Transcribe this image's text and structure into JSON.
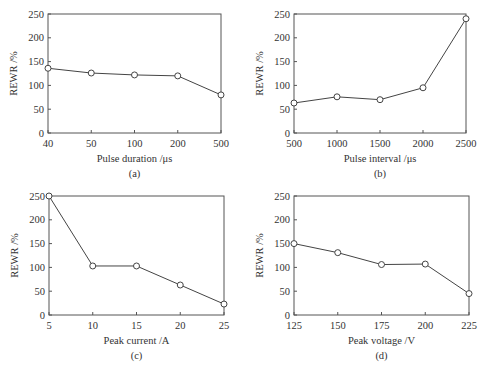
{
  "chart_data": [
    {
      "type": "line",
      "panel": "(a)",
      "title": "",
      "xlabel": "Pulse duration /μs",
      "ylabel": "REWR /%",
      "categories": [
        "40",
        "50",
        "100",
        "200",
        "500"
      ],
      "series": [
        {
          "name": "REWR",
          "values": [
            136,
            126,
            122,
            120,
            80
          ]
        }
      ],
      "ylim": [
        0,
        250
      ],
      "yticks": [
        0,
        50,
        100,
        150,
        200,
        250
      ],
      "grid": false,
      "marker": "open-circle"
    },
    {
      "type": "line",
      "panel": "(b)",
      "title": "",
      "xlabel": "Pulse interval /μs",
      "ylabel": "REWR /%",
      "categories": [
        "500",
        "1000",
        "1500",
        "2000",
        "2500"
      ],
      "series": [
        {
          "name": "REWR",
          "values": [
            63,
            76,
            70,
            95,
            240
          ]
        }
      ],
      "ylim": [
        0,
        250
      ],
      "yticks": [
        0,
        50,
        100,
        150,
        200,
        250
      ],
      "grid": false,
      "marker": "open-circle"
    },
    {
      "type": "line",
      "panel": "(c)",
      "title": "",
      "xlabel": "Peak current /A",
      "ylabel": "REWR /%",
      "categories": [
        "5",
        "10",
        "15",
        "20",
        "25"
      ],
      "series": [
        {
          "name": "REWR",
          "values": [
            250,
            103,
            103,
            63,
            23
          ]
        }
      ],
      "ylim": [
        0,
        250
      ],
      "yticks": [
        0,
        50,
        100,
        150,
        200,
        250
      ],
      "grid": false,
      "marker": "open-circle"
    },
    {
      "type": "line",
      "panel": "(d)",
      "title": "",
      "xlabel": "Peak voltage /V",
      "ylabel": "REWR /%",
      "categories": [
        "125",
        "150",
        "175",
        "200",
        "225"
      ],
      "series": [
        {
          "name": "REWR",
          "values": [
            150,
            131,
            106,
            107,
            45
          ]
        }
      ],
      "ylim": [
        0,
        250
      ],
      "yticks": [
        0,
        50,
        100,
        150,
        200,
        250
      ],
      "grid": false,
      "marker": "open-circle"
    }
  ],
  "layout": {
    "panels": [
      {
        "x0": 48,
        "x1": 221,
        "y0": 14,
        "y1": 133
      },
      {
        "x0": 294,
        "x1": 466,
        "y0": 14,
        "y1": 133
      },
      {
        "x0": 49,
        "x1": 224,
        "y0": 196,
        "y1": 315
      },
      {
        "x0": 294,
        "x1": 469,
        "y0": 196,
        "y1": 315
      }
    ]
  }
}
